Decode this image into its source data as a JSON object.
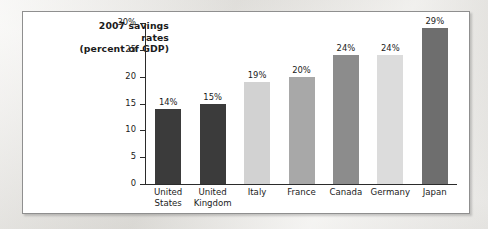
{
  "figure": {
    "title_lines": [
      "2007 savings",
      "rates",
      "(percent of GDP)"
    ]
  },
  "chart_data": {
    "type": "bar",
    "title": "2007 savings rates (percent of GDP)",
    "xlabel": "",
    "ylabel": "percent of GDP",
    "categories": [
      "United States",
      "United Kingdom",
      "Italy",
      "France",
      "Canada",
      "Germany",
      "Japan"
    ],
    "category_lines": [
      [
        "United",
        "States"
      ],
      [
        "United",
        "Kingdom"
      ],
      [
        "Italy"
      ],
      [
        "France"
      ],
      [
        "Canada"
      ],
      [
        "Germany"
      ],
      [
        "Japan"
      ]
    ],
    "values": [
      14,
      15,
      19,
      20,
      24,
      24,
      29
    ],
    "data_labels": [
      "14%",
      "15%",
      "19%",
      "20%",
      "24%",
      "24%",
      "29%"
    ],
    "bar_colors": [
      "#3b3b3b",
      "#3b3b3b",
      "#d2d2d2",
      "#a8a8a8",
      "#8c8c8c",
      "#dcdcdc",
      "#6e6e6e"
    ],
    "ylim": [
      0,
      30
    ],
    "yticks": [
      0,
      5,
      10,
      15,
      20,
      25,
      30
    ],
    "ytick_labels": [
      "0",
      "5",
      "10",
      "15",
      "20",
      "25",
      "30%"
    ],
    "grid": false,
    "legend": null
  },
  "colors": {
    "axis": "#2b2b2b",
    "frame_border": "#8f8f8f",
    "plot_background": "#ffffff",
    "page_background": "#e9e7e2",
    "text": "#1b1b1b"
  }
}
